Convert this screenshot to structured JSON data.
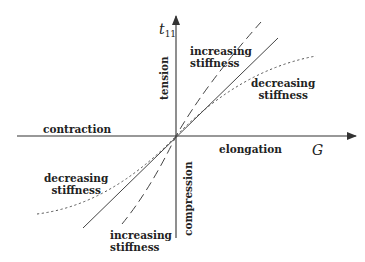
{
  "axes": {
    "y_label": "t",
    "y_label_sub": "11",
    "x_label": "G",
    "positive_y": "tension",
    "negative_y": "compression",
    "positive_x": "elongation",
    "negative_x": "contraction"
  },
  "annotations": {
    "upper_increasing": [
      "increasing",
      "stiffness"
    ],
    "upper_decreasing": [
      "decreasing",
      "stiffness"
    ],
    "lower_decreasing": [
      "decreasing",
      "stiffness"
    ],
    "lower_increasing": [
      "increasing",
      "stiffness"
    ]
  },
  "curves": [
    {
      "name": "increasing stiffness",
      "style": "dashed"
    },
    {
      "name": "linear",
      "style": "solid"
    },
    {
      "name": "decreasing stiffness",
      "style": "dotted"
    }
  ],
  "colors": {
    "ink": "#222222",
    "axis": "#333333",
    "background": "#ffffff"
  }
}
